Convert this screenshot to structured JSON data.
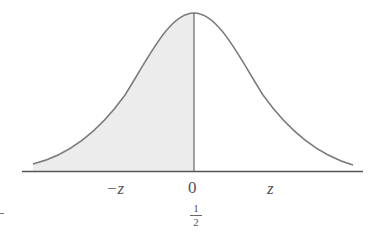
{
  "diagram": {
    "type": "standard normal curve with shaded left half",
    "colors": {
      "curve": "#7a7a7a",
      "shade": "#ececec",
      "axis": "#555555",
      "text": "#555555"
    },
    "labels": {
      "neg_z": "−z",
      "zero": "0",
      "z": "z",
      "half_num": "1",
      "half_den": "2",
      "left_mark": "-"
    }
  }
}
